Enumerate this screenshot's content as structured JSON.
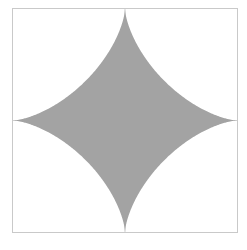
{
  "figure": {
    "name": "astroid-plot",
    "background_color": "#ffffff",
    "frame": {
      "border_color": "#c9c9c9",
      "fill_color": "#ffffff",
      "left": 12,
      "top": 8,
      "width": 226,
      "height": 225
    },
    "axes": {
      "line_color": "#bcbcbc",
      "horizontal_y_fraction": 0.5,
      "vertical_x_fraction": 0.5
    },
    "shape": {
      "kind": "astroid",
      "equation": "|x|^(2/3) + |y|^(2/3) = 1",
      "fill_color": "#a3a3a3",
      "stroke_color": "none",
      "cusps": [
        "top",
        "right",
        "bottom",
        "left"
      ],
      "path": "M 100 0 C 86 46 46 86 0 100 C 46 114 86 154 100 200 C 114 154 154 114 200 100 C 154 86 114 46 100 0 Z"
    }
  },
  "chart_data": {
    "type": "line",
    "title": "",
    "subtitle": "",
    "xlabel": "",
    "ylabel": "",
    "xlim": [
      -1,
      1
    ],
    "ylim": [
      -1,
      1
    ],
    "grid": false,
    "legend": "none",
    "tick_labels": {
      "x": [],
      "y": []
    },
    "annotations": [],
    "series": [
      {
        "name": "astroid",
        "type": "filled-curve",
        "color": "#a3a3a3",
        "parametric": "x = cos(t)^3, y = sin(t)^3, t in [0, 2pi]",
        "x": [
          1.0,
          0.65,
          0.35,
          0.13,
          0.0,
          -0.13,
          -0.35,
          -0.65,
          -1.0,
          -0.65,
          -0.35,
          -0.13,
          0.0,
          0.13,
          0.35,
          0.65,
          1.0
        ],
        "y": [
          0.0,
          0.13,
          0.35,
          0.65,
          1.0,
          0.65,
          0.35,
          0.13,
          0.0,
          -0.13,
          -0.35,
          -0.65,
          -1.0,
          -0.65,
          -0.35,
          -0.13,
          0.0
        ]
      }
    ]
  }
}
